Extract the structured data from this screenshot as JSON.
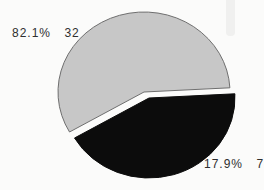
{
  "figure": {
    "background_color": "#fbfbfa",
    "text_color": "#2f2f2f"
  },
  "chart_data": {
    "type": "pie",
    "title": "",
    "total": 39,
    "legend": "none",
    "labels_position": "outside",
    "slices": [
      {
        "name": "major",
        "percent": 82.1,
        "count": 32,
        "percent_text": "82.1%",
        "count_text": "32",
        "color": "#c7c7c7",
        "outline_color": "#6f6f6f",
        "exploded": false
      },
      {
        "name": "minor",
        "percent": 17.9,
        "count": 7,
        "percent_text": "17.9%",
        "count_text": "7",
        "color": "#0c0c0c",
        "outline_color": "#0c0c0c",
        "exploded": true
      }
    ],
    "layout": {
      "center_x": 144,
      "center_y": 92,
      "radius_x": 86,
      "radius_y": 80,
      "drawn_angles": [
        {
          "start_deg": 3,
          "end_deg": 210
        },
        {
          "start_deg": 210,
          "end_deg": 363
        }
      ],
      "explode_dx": 5,
      "explode_dy": 6
    }
  }
}
